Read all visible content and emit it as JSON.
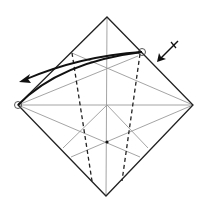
{
  "diagram": {
    "title": "",
    "type": "origami-fold-step",
    "colors": {
      "edge": "#222222",
      "crease": "#9a9a9a",
      "valley_fold": "#222222",
      "arrow": "#111111"
    },
    "square": {
      "top": [
        107,
        17
      ],
      "right": [
        193,
        105
      ],
      "bottom": [
        106,
        196
      ],
      "left": [
        18,
        105
      ]
    },
    "points": {
      "center": [
        107,
        105
      ],
      "intersection": [
        107,
        142
      ],
      "upper_left_ref": [
        72,
        53
      ],
      "upper_right_ref": [
        142,
        52
      ]
    },
    "markers": [
      {
        "name": "left-vertex-circle",
        "shape": "circle"
      },
      {
        "name": "upper-right-circle",
        "shape": "circle"
      }
    ],
    "arrows": [
      {
        "name": "fold-arrow",
        "from": "upper-right",
        "to": "left",
        "style": "curved"
      },
      {
        "name": "push-arrow",
        "style": "straight-with-tick"
      }
    ],
    "fold_lines": [
      {
        "type": "valley",
        "label": "dashed"
      }
    ]
  }
}
